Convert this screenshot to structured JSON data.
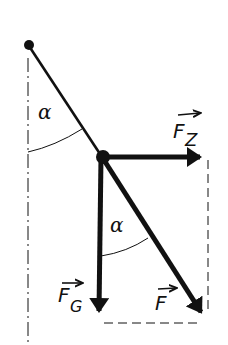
{
  "diagram": {
    "colors": {
      "ink": "#111111",
      "background": "#ffffff"
    },
    "labels": {
      "angle_top": "α",
      "angle_bottom": "α",
      "centripetal_force": "F",
      "centripetal_force_sub": "Z",
      "gravity_force": "F",
      "gravity_force_sub": "G",
      "resultant_force": "F"
    },
    "elements": [
      {
        "id": "pivot",
        "type": "point"
      },
      {
        "id": "string",
        "type": "line",
        "from": "pivot",
        "to": "mass"
      },
      {
        "id": "vertical-reference",
        "type": "dash-dot-line"
      },
      {
        "id": "mass",
        "type": "point"
      },
      {
        "id": "force-centripetal",
        "type": "vector",
        "label": "F_Z",
        "direction": "right"
      },
      {
        "id": "force-gravity",
        "type": "vector",
        "label": "F_G",
        "direction": "down"
      },
      {
        "id": "force-resultant",
        "type": "vector",
        "label": "F",
        "direction": "down-right"
      },
      {
        "id": "parallelogram-right",
        "type": "dashed-line"
      },
      {
        "id": "parallelogram-bottom",
        "type": "dashed-line"
      }
    ]
  }
}
